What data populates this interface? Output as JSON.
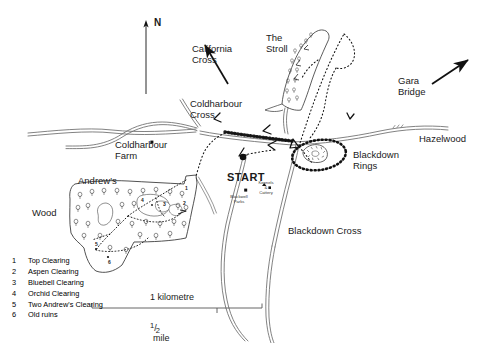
{
  "map": {
    "title": "Blackdown Rings and Andrew's Wood walking map",
    "background_color": "#ffffff",
    "ink_color": "#1a1a1a"
  },
  "compass": {
    "north_label": "N"
  },
  "direction_labels": [
    {
      "id": "california-cross",
      "text": "California\nCross"
    },
    {
      "id": "gara-bridge",
      "text": "Gara\nBridge"
    }
  ],
  "place_labels": [
    {
      "id": "the-stroll",
      "text": "The\nStroll"
    },
    {
      "id": "coldharbour-cross",
      "text": "Coldharbour\nCross"
    },
    {
      "id": "coldharbour-farm",
      "text": "Coldharbour\nFarm"
    },
    {
      "id": "andrews",
      "text": "Andrew's"
    },
    {
      "id": "wood",
      "text": "Wood"
    },
    {
      "id": "blackdown-rings",
      "text": "Blackdown\nRings"
    },
    {
      "id": "hazelwood",
      "text": "Hazelwood"
    },
    {
      "id": "blackdown-cross",
      "text": "Blackdown Cross"
    }
  ],
  "small_labels": [
    {
      "id": "blackwell-parks",
      "text": "Blackwell\nParks"
    },
    {
      "id": "kennels-cattery",
      "text": "Kennels\n&\nCattery"
    }
  ],
  "start_marker": {
    "label": "START"
  },
  "clearing_numbers": [
    "1",
    "2",
    "3",
    "4",
    "5",
    "6"
  ],
  "legend": {
    "items": [
      {
        "number": "1",
        "label": "Top Clearing"
      },
      {
        "number": "2",
        "label": "Aspen Clearing"
      },
      {
        "number": "3",
        "label": "Bluebell Clearing"
      },
      {
        "number": "4",
        "label": "Orchid Clearing"
      },
      {
        "number": "5",
        "label": "Two Andrew's Clearing"
      },
      {
        "number": "6",
        "label": "Old ruins"
      }
    ]
  },
  "scale_bar": {
    "top_label": "1 kilometre",
    "bottom_numerator": "1",
    "bottom_denominator": "2",
    "bottom_unit": "mile"
  }
}
